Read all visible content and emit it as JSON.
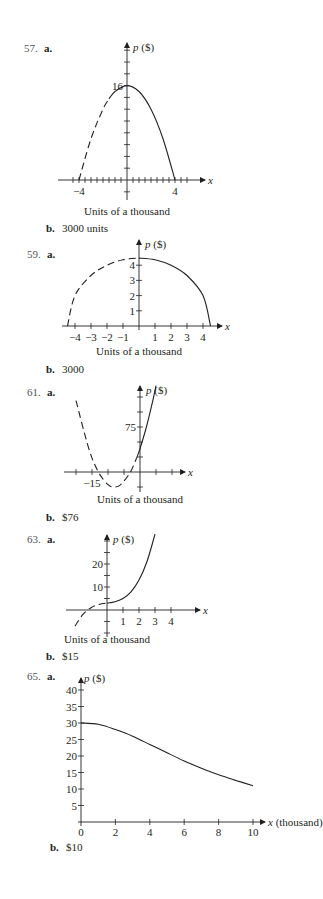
{
  "chart_data": [
    {
      "id": "57",
      "type": "line",
      "problem_label": "57.",
      "part_a_label": "a.",
      "part_b_label": "b.",
      "answer_b": "3000 units",
      "ylabel": "p ($)",
      "xlabel": "x",
      "caption": "Units of a thousand",
      "x_tick_labels": [
        {
          "x": -4,
          "label": "−4"
        },
        {
          "x": 4,
          "label": "4"
        }
      ],
      "y_tick_labels": [
        {
          "y": 16,
          "label": "16"
        }
      ],
      "xlim": [
        -4.5,
        5
      ],
      "ylim": [
        -2,
        22
      ],
      "x_tick_step": 0.5,
      "y_tick_step": 2,
      "function": "p = 16 - x^2",
      "series": [
        {
          "name": "dashed",
          "style": "dashed",
          "x": [
            -4,
            -3,
            -2,
            -1.5
          ],
          "y": [
            0,
            7,
            12,
            13.75
          ]
        },
        {
          "name": "solid",
          "style": "solid",
          "x": [
            -1.5,
            -1,
            0,
            1,
            2,
            3,
            4
          ],
          "y": [
            13.75,
            15,
            16,
            15,
            12,
            7,
            0
          ]
        }
      ]
    },
    {
      "id": "59",
      "type": "line",
      "problem_label": "59.",
      "part_a_label": "a.",
      "part_b_label": "b.",
      "answer_b": "3000",
      "ylabel": "p ($)",
      "xlabel": "x",
      "caption": "Units of a thousand",
      "x_tick_labels": [
        {
          "x": -4,
          "label": "−4"
        },
        {
          "x": -3,
          "label": "−3"
        },
        {
          "x": -2,
          "label": "−2"
        },
        {
          "x": -1,
          "label": "−1"
        },
        {
          "x": 1,
          "label": "1"
        },
        {
          "x": 2,
          "label": "2"
        },
        {
          "x": 3,
          "label": "3"
        },
        {
          "x": 4,
          "label": "4"
        }
      ],
      "y_tick_labels": [
        {
          "y": 1,
          "label": "1"
        },
        {
          "y": 2,
          "label": "2"
        },
        {
          "y": 3,
          "label": "3"
        },
        {
          "y": 4,
          "label": "4"
        }
      ],
      "xlim": [
        -4.7,
        5
      ],
      "ylim": [
        0,
        5
      ],
      "function": "p = sqrt(20 - x^2)",
      "series": [
        {
          "name": "dashed",
          "style": "dashed",
          "x": [
            -4.47,
            -4,
            -3,
            -2,
            -1,
            0
          ],
          "y": [
            0,
            2,
            3.32,
            4,
            4.36,
            4.47
          ]
        },
        {
          "name": "solid",
          "style": "solid",
          "x": [
            0,
            1,
            2,
            3,
            4,
            4.47
          ],
          "y": [
            4.47,
            4.36,
            4,
            3.32,
            2,
            0
          ]
        }
      ]
    },
    {
      "id": "61",
      "type": "line",
      "problem_label": "61.",
      "part_a_label": "a.",
      "part_b_label": "b.",
      "answer_b": "$76",
      "ylabel": "p ($)",
      "xlabel": "x",
      "caption": "Units of a thousand",
      "x_tick_labels": [
        {
          "x": -15,
          "label": "−15"
        }
      ],
      "y_tick_labels": [
        {
          "y": 75,
          "label": "75"
        }
      ],
      "xlim": [
        -30,
        12
      ],
      "ylim": [
        -35,
        140
      ],
      "x_tick_step": 5,
      "y_tick_step": 25,
      "function": "p = x^2 + 16x + 39",
      "series": [
        {
          "name": "dashed",
          "style": "dashed",
          "x": [
            -20,
            -16,
            -13,
            -10,
            -8,
            -6,
            -3,
            -1
          ],
          "y": [
            119,
            39,
            0,
            -21,
            -25,
            -21,
            0,
            24
          ]
        },
        {
          "name": "solid",
          "style": "solid",
          "x": [
            -1,
            0,
            2,
            4,
            5
          ],
          "y": [
            24,
            39,
            75,
            119,
            144
          ]
        }
      ]
    },
    {
      "id": "63",
      "type": "line",
      "problem_label": "63.",
      "part_a_label": "a.",
      "part_b_label": "b.",
      "answer_b": "$15",
      "ylabel": "p ($)",
      "xlabel": "x",
      "caption": "Units of a thousand",
      "x_tick_labels": [
        {
          "x": 1,
          "label": "1"
        },
        {
          "x": 2,
          "label": "2"
        },
        {
          "x": 3,
          "label": "3"
        },
        {
          "x": 4,
          "label": "4"
        }
      ],
      "y_tick_labels": [
        {
          "y": 10,
          "label": "10"
        },
        {
          "y": 20,
          "label": "20"
        }
      ],
      "xlim": [
        -3,
        6
      ],
      "ylim": [
        -10,
        32
      ],
      "y_tick_step": 5,
      "function": "p = x^3 + x + 3",
      "series": [
        {
          "name": "dashed",
          "style": "dashed",
          "x": [
            -2,
            -1.5,
            -1,
            -0.5,
            0
          ],
          "y": [
            -7,
            -1.9,
            1,
            2.4,
            3
          ]
        },
        {
          "name": "solid",
          "style": "solid",
          "x": [
            0,
            0.5,
            1,
            1.5,
            2,
            2.5,
            3
          ],
          "y": [
            3,
            3.6,
            5,
            7.9,
            13,
            21.1,
            33
          ]
        }
      ]
    },
    {
      "id": "65",
      "type": "line",
      "problem_label": "65.",
      "part_a_label": "a.",
      "part_b_label": "b.",
      "answer_b": "$10",
      "ylabel": "p ($)",
      "xlabel": "x (thousand)",
      "caption": "",
      "x_tick_labels": [
        {
          "x": 0,
          "label": "0"
        },
        {
          "x": 2,
          "label": "2"
        },
        {
          "x": 4,
          "label": "4"
        },
        {
          "x": 6,
          "label": "6"
        },
        {
          "x": 8,
          "label": "8"
        },
        {
          "x": 10,
          "label": "10"
        }
      ],
      "y_tick_labels": [
        {
          "y": 5,
          "label": "5"
        },
        {
          "y": 10,
          "label": "10"
        },
        {
          "y": 15,
          "label": "15"
        },
        {
          "y": 20,
          "label": "20"
        },
        {
          "y": 25,
          "label": "25"
        },
        {
          "y": 30,
          "label": "30"
        },
        {
          "y": 35,
          "label": "35"
        },
        {
          "y": 40,
          "label": "40"
        }
      ],
      "xlim": [
        0,
        10.5
      ],
      "ylim": [
        0,
        42
      ],
      "series": [
        {
          "name": "solid",
          "style": "solid",
          "x": [
            0,
            1,
            2,
            3,
            4,
            5,
            6,
            7,
            8,
            9,
            10
          ],
          "y": [
            30,
            29.6,
            28,
            26,
            23.5,
            21,
            18.5,
            16.3,
            14.3,
            12.6,
            11
          ]
        }
      ]
    }
  ]
}
